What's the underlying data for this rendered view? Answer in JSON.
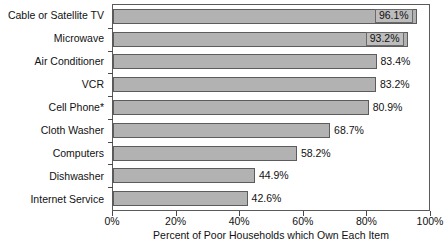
{
  "chart_data": {
    "type": "bar",
    "orientation": "horizontal",
    "title": "",
    "xlabel": "Percent of Poor Households which Own Each Item",
    "ylabel": "",
    "xlim": [
      0,
      100
    ],
    "grid": false,
    "legend": null,
    "categories": [
      "Cable or Satellite TV",
      "Microwave",
      "Air Conditioner",
      "VCR",
      "Cell Phone*",
      "Cloth Washer",
      "Computers",
      "Dishwasher",
      "Internet Service"
    ],
    "values": [
      96.1,
      93.2,
      83.4,
      83.2,
      80.9,
      68.7,
      58.2,
      44.9,
      42.6
    ],
    "data_labels": [
      "96.1%",
      "93.2%",
      "83.4%",
      "83.2%",
      "80.9%",
      "68.7%",
      "58.2%",
      "44.9%",
      "42.6%"
    ],
    "label_positions": [
      "inside",
      "inside",
      "outside",
      "outside",
      "outside",
      "outside",
      "outside",
      "outside",
      "outside"
    ],
    "xticks": [
      0,
      20,
      40,
      60,
      80,
      100
    ],
    "xticklabels": [
      "0%",
      "20%",
      "40%",
      "60%",
      "80%",
      "100%"
    ],
    "colors": {
      "bar_fill": "#b2b2b2",
      "bar_border": "#5c5c5c",
      "axis": "#5a5a5a",
      "text": "#111111",
      "background": "#ffffff",
      "label_box_fill": "#bdbdbd"
    }
  },
  "footnote": ""
}
